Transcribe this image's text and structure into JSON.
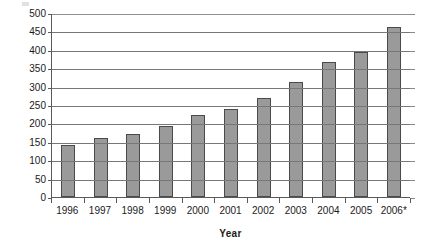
{
  "chart_data": {
    "type": "bar",
    "title": "",
    "xlabel": "Year",
    "ylabel": "Visits (mns)",
    "categories": [
      "1996",
      "1997",
      "1998",
      "1999",
      "2000",
      "2001",
      "2002",
      "2003",
      "2004",
      "2005",
      "2006*"
    ],
    "values": [
      140,
      160,
      170,
      192,
      222,
      238,
      270,
      313,
      368,
      395,
      463
    ],
    "ylim": [
      0,
      500
    ],
    "ytick_step": 50,
    "yticks": [
      "500",
      "450",
      "400",
      "350",
      "300",
      "250",
      "200",
      "150",
      "100",
      "50",
      "0"
    ],
    "ytick_values": [
      500,
      450,
      400,
      350,
      300,
      250,
      200,
      150,
      100,
      50,
      0
    ],
    "grid": true,
    "grid_axis": "y",
    "legend": false,
    "bar_color": "#9a9a9a",
    "bar_border_color": "#4a4a4a",
    "gridline_color": "#777777",
    "axis_color": "#5a5a5a",
    "background": "#ffffff",
    "footnote_marker": "*"
  }
}
